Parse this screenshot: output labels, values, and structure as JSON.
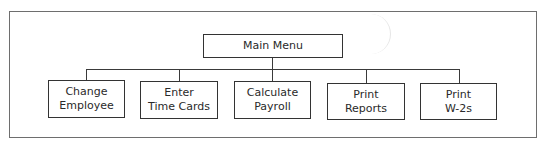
{
  "diagram": {
    "type": "hierarchy-chart",
    "root": {
      "label": "Main Menu"
    },
    "children": [
      {
        "line1": "Change",
        "line2": "Employee"
      },
      {
        "line1": "Enter",
        "line2": "Time Cards"
      },
      {
        "line1": "Calculate",
        "line2": "Payroll"
      },
      {
        "line1": "Print",
        "line2": "Reports"
      },
      {
        "line1": "Print",
        "line2": "W-2s"
      }
    ]
  }
}
